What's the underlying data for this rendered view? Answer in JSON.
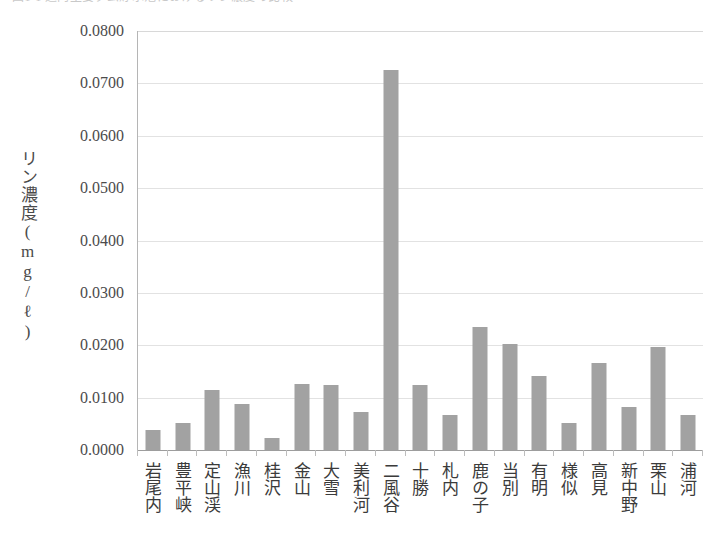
{
  "caption": {
    "text": "図1-1  道内主要ダム貯水池におけるリン濃度の比較"
  },
  "chart_data": {
    "type": "bar",
    "title": "",
    "xlabel": "",
    "ylabel": "リン濃度(mg/ℓ)",
    "ylim": [
      0.0,
      0.08
    ],
    "ytick_step": 0.01,
    "grid": true,
    "legend": "none",
    "bar_color": "#a2a2a2",
    "axis_color": "#9d9d9d",
    "grid_color": "#e2e2e2",
    "ytick_labels": [
      "0.0800",
      "0.0700",
      "0.0600",
      "0.0500",
      "0.0400",
      "0.0300",
      "0.0200",
      "0.0100",
      "0.0000"
    ],
    "ytick_values": [
      0.08,
      0.07,
      0.06,
      0.05,
      0.04,
      0.03,
      0.02,
      0.01,
      0.0
    ],
    "categories": [
      "岩尾内",
      "豊平峡",
      "定山渓",
      "漁川",
      "桂沢",
      "金山",
      "大雪",
      "美利河",
      "二風谷",
      "十勝",
      "札内",
      "鹿の子",
      "当別",
      "有明",
      "様似",
      "高見",
      "新中野",
      "栗山",
      "浦河"
    ],
    "values": [
      0.0038,
      0.0051,
      0.0115,
      0.0088,
      0.0023,
      0.0126,
      0.0124,
      0.0073,
      0.0725,
      0.0125,
      0.0067,
      0.0234,
      0.0203,
      0.0142,
      0.0051,
      0.0166,
      0.0082,
      0.0197,
      0.0067
    ]
  }
}
